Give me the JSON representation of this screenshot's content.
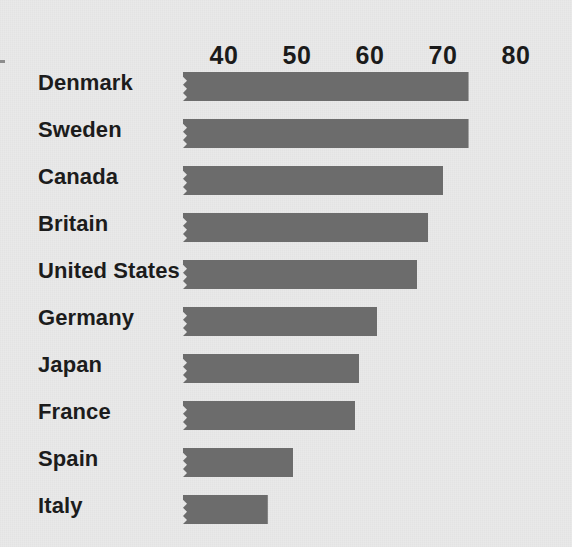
{
  "chart_data": {
    "type": "bar",
    "orientation": "horizontal",
    "title": "",
    "subtitle": "",
    "xlabel": "",
    "ylabel": "",
    "categories": [
      "Denmark",
      "Sweden",
      "Canada",
      "Britain",
      "United States",
      "Germany",
      "Japan",
      "France",
      "Spain",
      "Italy"
    ],
    "values": [
      73.5,
      73.5,
      70,
      68,
      66.5,
      61,
      58.5,
      58,
      49.5,
      46
    ],
    "xticks": [
      40,
      50,
      60,
      70,
      80
    ],
    "xtick_labels": [
      "40",
      "50",
      "60",
      "70",
      "80"
    ],
    "xlim": [
      34.4,
      82
    ],
    "axis_position": "top",
    "grid": false,
    "legend": null,
    "bar_color": "#6c6c6c",
    "background_color": "#e9e9e9",
    "text_color": "#1c1c1c",
    "bar_left_edge_style": "zigzag-torn"
  },
  "axis": {
    "ticks": [
      {
        "label": "40",
        "value": 40
      },
      {
        "label": "50",
        "value": 50
      },
      {
        "label": "60",
        "value": 60
      },
      {
        "label": "70",
        "value": 70
      },
      {
        "label": "80",
        "value": 80
      }
    ]
  },
  "bars": [
    {
      "label": "Denmark",
      "value": 73.5
    },
    {
      "label": "Sweden",
      "value": 73.5
    },
    {
      "label": "Canada",
      "value": 70
    },
    {
      "label": "Britain",
      "value": 68
    },
    {
      "label": "United States",
      "value": 66.5
    },
    {
      "label": "Germany",
      "value": 61
    },
    {
      "label": "Japan",
      "value": 58.5
    },
    {
      "label": "France",
      "value": 58
    },
    {
      "label": "Spain",
      "value": 49.5
    },
    {
      "label": "Italy",
      "value": 46
    }
  ]
}
